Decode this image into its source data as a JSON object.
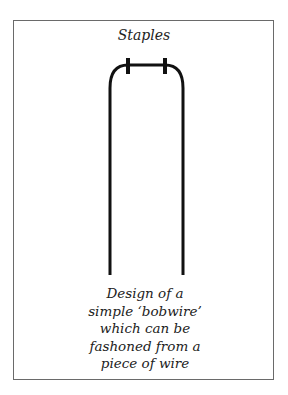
{
  "diagram": {
    "top_label": "Staples",
    "caption_lines": [
      "Design of a",
      "simple ‘bobwire’",
      "which can be",
      "fashoned from a",
      "piece of wire"
    ],
    "colors": {
      "wire": "#111111",
      "frame": "#6a6a6a",
      "text": "#222222"
    }
  }
}
